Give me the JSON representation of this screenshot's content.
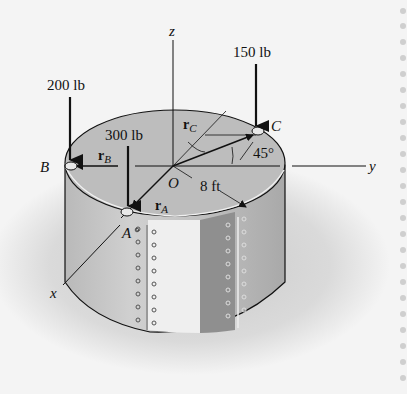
{
  "figure": {
    "axes": {
      "x": "x",
      "y": "y",
      "z": "z"
    },
    "origin": "O",
    "points": {
      "A": "A",
      "B": "B",
      "C": "C"
    },
    "forces": [
      {
        "point": "B",
        "label": "200 lb"
      },
      {
        "point": "A",
        "label": "300 lb"
      },
      {
        "point": "C",
        "label": "150 lb"
      }
    ],
    "vectors": {
      "rA": {
        "base": "r",
        "sub": "A"
      },
      "rB": {
        "base": "r",
        "sub": "B"
      },
      "rC": {
        "base": "r",
        "sub": "C"
      }
    },
    "radius_label": "8 ft",
    "angle_label": "45°",
    "colors": {
      "background": "#f4f4f4",
      "tank_top": "#bdbdbd",
      "tank_side": "#c8c8c8",
      "panel_light": "#ececec",
      "panel_dark": "#8f8f8f",
      "ink": "#111111",
      "shadow": "#cfcfcf"
    }
  }
}
